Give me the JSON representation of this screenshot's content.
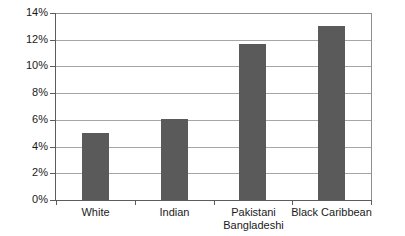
{
  "chart_data": {
    "type": "bar",
    "title": "",
    "xlabel": "",
    "ylabel": "",
    "categories": [
      "White",
      "Indian",
      "Pakistani\nBangladeshi",
      "Black Caribbean"
    ],
    "values": [
      5.0,
      6.1,
      11.7,
      13.0
    ],
    "ylim": [
      0,
      14
    ],
    "ytick_values": [
      0,
      2,
      4,
      6,
      8,
      10,
      12,
      14
    ],
    "ytick_labels": [
      "0%",
      "2%",
      "4%",
      "6%",
      "8%",
      "10%",
      "12%",
      "14%"
    ],
    "grid": true,
    "legend": null,
    "bar_color": "#5a5a5a",
    "gridline_color": "#a6a6a6",
    "axis_color": "#5c5c5c",
    "background_color": "#ffffff",
    "text_color": "#1a1a1a"
  }
}
